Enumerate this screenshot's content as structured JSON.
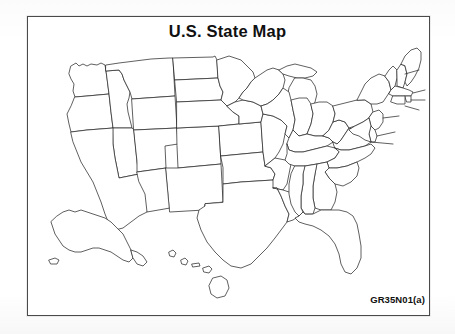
{
  "page": {
    "title": "U.S. State Map",
    "code_label": "GR35N01(a)",
    "background_color": "#ffffff",
    "frame_color": "#4a4a4a",
    "outline_color": "#2b2b2b",
    "text_color": "#101010"
  },
  "map": {
    "name": "united-states-outline-map",
    "description": "Blank outline map of the United States showing state borders, with Alaska and Hawaii insets at lower left",
    "labels_shown": false,
    "regions": [
      {
        "name": "contiguous-united-states",
        "label": ""
      },
      {
        "name": "alaska-inset",
        "label": ""
      },
      {
        "name": "hawaii-inset",
        "label": ""
      }
    ]
  }
}
